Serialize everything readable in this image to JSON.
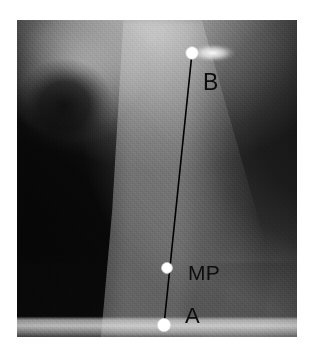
{
  "figure": {
    "type": "annotated-grayscale-anatomical-photograph",
    "width": 314,
    "height": 356,
    "background_color": "#ffffff",
    "plate": {
      "left": 17,
      "top": 20,
      "width": 280,
      "height": 317,
      "description": "Grayscale photograph of a limb/joint specimen with dark soft tissue at left and upper right and a bright tapered tissue column at center-right"
    }
  },
  "annotations": {
    "line_color": "#000000",
    "line_width": 1.6,
    "marker_fill": "#ffffff",
    "marker_edge": "#d8d8d8",
    "label_color": "#0d0d0d",
    "measurement_line": {
      "name": "A-to-B measurement axis",
      "from": "A",
      "to": "B"
    },
    "landmarks": [
      {
        "id": "B",
        "label": "B",
        "x": 192,
        "y": 53,
        "radius": 6.2,
        "label_x": 203,
        "label_y": 71,
        "description": "Proximal landmark marker at top of measurement line"
      },
      {
        "id": "MP",
        "label": "MP",
        "x": 167,
        "y": 268,
        "radius": 5.4,
        "label_x": 188,
        "label_y": 262,
        "description": "Midpoint landmark marker on measurement line"
      },
      {
        "id": "A",
        "label": "A",
        "x": 164,
        "y": 325,
        "radius": 6.6,
        "label_x": 185,
        "label_y": 305,
        "description": "Distal landmark marker at base of measurement line"
      }
    ]
  }
}
